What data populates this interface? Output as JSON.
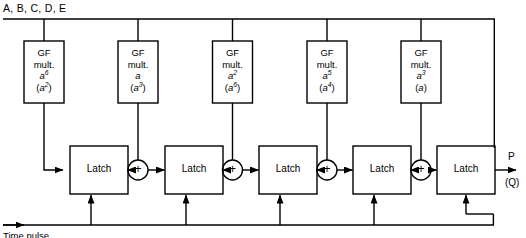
{
  "figure": {
    "title_top_label": "A, B, C, D, E",
    "clock_label": "Time pulse",
    "output_primary": "P",
    "output_secondary": "(Q)"
  },
  "gf_multipliers": [
    {
      "line1": "GF",
      "line2": "mult.",
      "coef_base": "a",
      "coef_exp": "6",
      "alt_base": "a",
      "alt_exp": "2",
      "alt_text": "(a2)"
    },
    {
      "line1": "GF",
      "line2": "mult.",
      "coef_base": "a",
      "coef_exp": "",
      "alt_base": "a",
      "alt_exp": "3",
      "alt_text": "(a3)"
    },
    {
      "line1": "GF",
      "line2": "mult.",
      "coef_base": "a",
      "coef_exp": "2",
      "alt_base": "a",
      "alt_exp": "6",
      "alt_text": "(a6)"
    },
    {
      "line1": "GF",
      "line2": "mult.",
      "coef_base": "a",
      "coef_exp": "5",
      "alt_base": "a",
      "alt_exp": "4",
      "alt_text": "(a4)"
    },
    {
      "line1": "GF",
      "line2": "mult.",
      "coef_base": "a",
      "coef_exp": "3",
      "alt_base": "a",
      "alt_exp": "",
      "alt_text": "(a)"
    }
  ],
  "latches": [
    {
      "label": "Latch"
    },
    {
      "label": "Latch"
    },
    {
      "label": "Latch"
    },
    {
      "label": "Latch"
    },
    {
      "label": "Latch"
    }
  ],
  "adders": [
    {
      "symbol": "+"
    },
    {
      "symbol": "+"
    },
    {
      "symbol": "+"
    },
    {
      "symbol": "+"
    }
  ],
  "colors": {
    "line": "#000000",
    "background": "#ffffff",
    "text": "#000000"
  }
}
